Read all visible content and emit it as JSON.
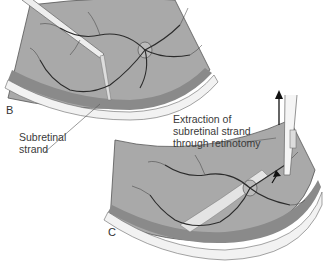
{
  "figure": {
    "panels": [
      {
        "letter": "B",
        "annotation_lines": [
          "Subretinal",
          "strand"
        ]
      },
      {
        "letter": "C",
        "annotation_lines": [
          "Extraction of",
          "subretinal strand",
          "through retinotomy"
        ]
      }
    ],
    "colors": {
      "retina": "#a9a9a9",
      "retina_light": "#c4c4c4",
      "sclera": "#f2f2f2",
      "choroid_band": "#8a8a8a",
      "vessel": "#2b2b2b",
      "outline": "#555555"
    }
  }
}
